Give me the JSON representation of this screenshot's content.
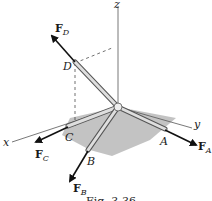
{
  "figure": {
    "caption": "Fig. 3-36",
    "axes": {
      "x_label": "x",
      "y_label": "y",
      "z_label": "z"
    },
    "points": [
      {
        "id": "A",
        "label": "A"
      },
      {
        "id": "B",
        "label": "B"
      },
      {
        "id": "C",
        "label": "C"
      },
      {
        "id": "D",
        "label": "D"
      }
    ],
    "forces": [
      {
        "id": "FA",
        "main": "F",
        "sub": "A"
      },
      {
        "id": "FB",
        "main": "F",
        "sub": "B"
      },
      {
        "id": "FC",
        "main": "F",
        "sub": "C"
      },
      {
        "id": "FD",
        "main": "F",
        "sub": "D"
      }
    ],
    "colors": {
      "ground_shade": "#b5b5b5",
      "member_fill": "#d9d9d9",
      "member_edge": "#555555",
      "arrow": "#111111",
      "axis": "#444444"
    }
  }
}
